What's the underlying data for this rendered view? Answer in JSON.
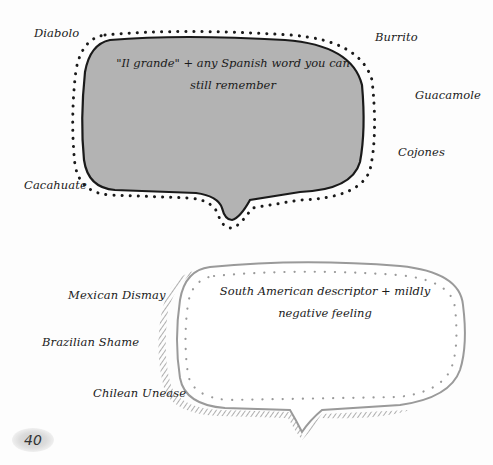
{
  "bubble_top": {
    "prompt": "\"Il grande\" + any Spanish word you can still remember",
    "line1": "\"Il grande\" + any Spanish word you can",
    "line2": "still remember",
    "fill_color": "#b3b3b3",
    "outline_color": "#1a1a1a"
  },
  "bubble_top_words": [
    {
      "text": "Diabolo"
    },
    {
      "text": "Burrito"
    },
    {
      "text": "Guacamole"
    },
    {
      "text": "Cojones"
    },
    {
      "text": "Cacahuate"
    }
  ],
  "bubble_bottom": {
    "prompt": "South American descriptor + mildly negative feeling",
    "line1": "South American descriptor + mildly",
    "line2": "negative feeling",
    "fill_color": "#ffffff",
    "outline_color": "#9a9a9a"
  },
  "bubble_bottom_words": [
    {
      "text": "Mexican Dismay"
    },
    {
      "text": "Brazilian Shame"
    },
    {
      "text": "Chilean Unease"
    }
  ],
  "page_number": "40"
}
